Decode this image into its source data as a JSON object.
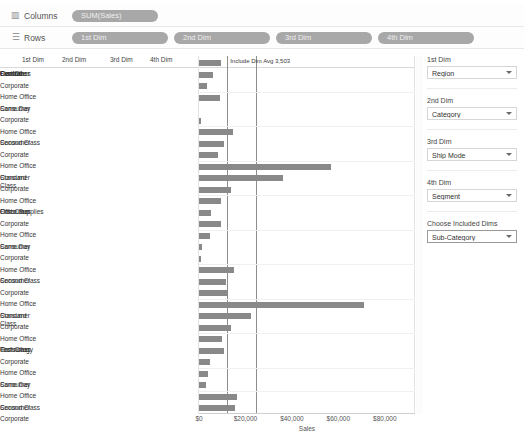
{
  "shelves": {
    "columns": {
      "icon": "columns-bars-icon",
      "label": "Columns",
      "pill": "SUM(Sales)"
    },
    "rows": {
      "icon": "rows-hamburger-icon",
      "label": "Rows",
      "pills": [
        "1st Dim",
        "2nd Dim",
        "3rd Dim",
        "4th Dim"
      ]
    }
  },
  "header": {
    "captions": [
      "1st Dim",
      "2nd Dim",
      "3rd Dim",
      "4th Dim"
    ]
  },
  "reference_lines": [
    {
      "name": "include-dim-avg",
      "label": "Include Dim Avg 3,503",
      "value": 3503
    },
    {
      "name": "overall-avg",
      "label": "Overall Avg: $16,084",
      "value": 16084
    }
  ],
  "panel": {
    "params": [
      {
        "title": "1st Dim",
        "value": "Region",
        "active": false
      },
      {
        "title": "2nd Dim",
        "value": "Category",
        "active": false
      },
      {
        "title": "3rd Dim",
        "value": "Ship Mode",
        "active": false
      },
      {
        "title": "4th Dim",
        "value": "Segment",
        "active": false
      },
      {
        "title": "Choose Included Dims",
        "value": "Sub-Category",
        "active": true
      }
    ]
  },
  "chart_data": {
    "type": "bar",
    "orientation": "horizontal",
    "title": "",
    "xlabel": "Sales",
    "ylabel": "",
    "xlim": [
      0,
      86000
    ],
    "grid": false,
    "ticks": [
      "$0",
      "$20,000",
      "$40,000",
      "$60,000",
      "$80,000"
    ],
    "tick_values": [
      0,
      20000,
      40000,
      60000,
      80000
    ],
    "dim_names": [
      "Region",
      "Category",
      "Ship Mode",
      "Segment"
    ],
    "region": "Central",
    "rows": [
      {
        "d1": "Central",
        "d2": "Furniture",
        "d3": "First Class",
        "d4": "Consumer",
        "value": 9500
      },
      {
        "d1": "",
        "d2": "",
        "d3": "",
        "d4": "Corporate",
        "value": 6100
      },
      {
        "d1": "",
        "d2": "",
        "d3": "",
        "d4": "Home Office",
        "value": 3500
      },
      {
        "d1": "",
        "d2": "",
        "d3": "Same Day",
        "d4": "Consumer",
        "value": 8900
      },
      {
        "d1": "",
        "d2": "",
        "d3": "",
        "d4": "Corporate",
        "value": 0
      },
      {
        "d1": "",
        "d2": "",
        "d3": "",
        "d4": "Home Office",
        "value": 700
      },
      {
        "d1": "",
        "d2": "",
        "d3": "Second Class",
        "d4": "Consumer",
        "value": 14500
      },
      {
        "d1": "",
        "d2": "",
        "d3": "",
        "d4": "Corporate",
        "value": 10900
      },
      {
        "d1": "",
        "d2": "",
        "d3": "",
        "d4": "Home Office",
        "value": 8200
      },
      {
        "d1": "",
        "d2": "",
        "d3": "Standard Class",
        "d4": "Consumer",
        "value": 57000
      },
      {
        "d1": "",
        "d2": "",
        "d3": "",
        "d4": "Corporate",
        "value": 36000
      },
      {
        "d1": "",
        "d2": "",
        "d3": "",
        "d4": "Home Office",
        "value": 13800
      },
      {
        "d1": "",
        "d2": "Office Supplies",
        "d3": "First Class",
        "d4": "Consumer",
        "value": 9300
      },
      {
        "d1": "",
        "d2": "",
        "d3": "",
        "d4": "Corporate",
        "value": 5200
      },
      {
        "d1": "",
        "d2": "",
        "d3": "",
        "d4": "Home Office",
        "value": 9600
      },
      {
        "d1": "",
        "d2": "",
        "d3": "Same Day",
        "d4": "Consumer",
        "value": 4600
      },
      {
        "d1": "",
        "d2": "",
        "d3": "",
        "d4": "Corporate",
        "value": 1300
      },
      {
        "d1": "",
        "d2": "",
        "d3": "",
        "d4": "Home Office",
        "value": 900
      },
      {
        "d1": "",
        "d2": "",
        "d3": "Second Class",
        "d4": "Consumer",
        "value": 15200
      },
      {
        "d1": "",
        "d2": "",
        "d3": "",
        "d4": "Corporate",
        "value": 11700
      },
      {
        "d1": "",
        "d2": "",
        "d3": "",
        "d4": "Home Office",
        "value": 12400
      },
      {
        "d1": "",
        "d2": "",
        "d3": "Standard Class",
        "d4": "Consumer",
        "value": 71000
      },
      {
        "d1": "",
        "d2": "",
        "d3": "",
        "d4": "Corporate",
        "value": 22600
      },
      {
        "d1": "",
        "d2": "",
        "d3": "",
        "d4": "Home Office",
        "value": 13800
      },
      {
        "d1": "",
        "d2": "Technology",
        "d3": "First Class",
        "d4": "Consumer",
        "value": 10100
      },
      {
        "d1": "",
        "d2": "",
        "d3": "",
        "d4": "Corporate",
        "value": 10600
      },
      {
        "d1": "",
        "d2": "",
        "d3": "",
        "d4": "Home Office",
        "value": 4800
      },
      {
        "d1": "",
        "d2": "",
        "d3": "Same Day",
        "d4": "Consumer",
        "value": 3900
      },
      {
        "d1": "",
        "d2": "",
        "d3": "",
        "d4": "Home Office",
        "value": 2800
      },
      {
        "d1": "",
        "d2": "",
        "d3": "Second Class",
        "d4": "Consumer",
        "value": 16200
      },
      {
        "d1": "",
        "d2": "",
        "d3": "",
        "d4": "Corporate",
        "value": 15500
      }
    ]
  }
}
